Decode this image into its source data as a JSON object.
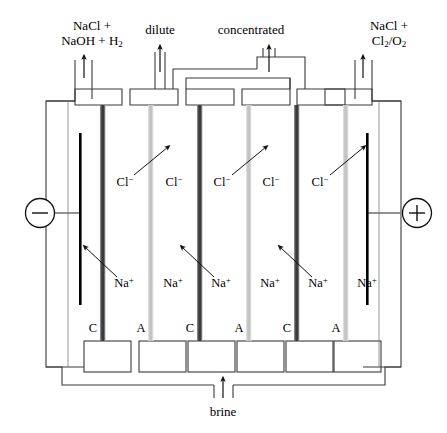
{
  "diagram": {
    "colors": {
      "line": "#3a3a3a",
      "electrode": "#000000",
      "cation_membrane": "#454545",
      "anion_membrane": "#c9c9c9",
      "background": "#ffffff"
    },
    "top_labels": [
      {
        "name": "outlet-left",
        "line1": "NaCl +",
        "line2_pre": "NaOH + H",
        "line2_sub": "2",
        "x": 92,
        "y": 18
      },
      {
        "name": "outlet-dilute",
        "line1": "dilute",
        "x": 160,
        "y": 22
      },
      {
        "name": "outlet-concentrated",
        "line1": "concentrated",
        "x": 250,
        "y": 22
      },
      {
        "name": "outlet-right",
        "line1": "NaCl +",
        "line2_pre": "Cl",
        "line2_sub": "2",
        "line2_mid": "/O",
        "line2_sub2": "2",
        "x": 389,
        "y": 18
      }
    ],
    "electrodes": {
      "cathode": {
        "label": "−",
        "name": "cathode-terminal",
        "x": 40,
        "y": 213
      },
      "anode": {
        "label": "+",
        "name": "anode-terminal",
        "x": 417,
        "y": 213
      }
    },
    "membranes": [
      {
        "id": "m1",
        "type": "cation",
        "letter": "C",
        "x": 103
      },
      {
        "id": "m2",
        "type": "anion",
        "letter": "A",
        "x": 151
      },
      {
        "id": "m3",
        "type": "cation",
        "letter": "C",
        "x": 200
      },
      {
        "id": "m4",
        "type": "anion",
        "letter": "A",
        "x": 249
      },
      {
        "id": "m5",
        "type": "cation",
        "letter": "C",
        "x": 297
      },
      {
        "id": "m6",
        "type": "anion",
        "letter": "A",
        "x": 346
      }
    ],
    "membrane_letters_y": 328,
    "chloride_labels": [
      {
        "text": "Cl",
        "charge": "−",
        "x": 125,
        "y": 179
      },
      {
        "text": "Cl",
        "charge": "−",
        "x": 174,
        "y": 179
      },
      {
        "text": "Cl",
        "charge": "−",
        "x": 222,
        "y": 179
      },
      {
        "text": "Cl",
        "charge": "−",
        "x": 271,
        "y": 179
      },
      {
        "text": "Cl",
        "charge": "−",
        "x": 320,
        "y": 179
      }
    ],
    "sodium_labels": [
      {
        "text": "Na",
        "charge": "+",
        "x": 124,
        "y": 280
      },
      {
        "text": "Na",
        "charge": "+",
        "x": 173,
        "y": 280
      },
      {
        "text": "Na",
        "charge": "+",
        "x": 221,
        "y": 280
      },
      {
        "text": "Na",
        "charge": "+",
        "x": 270,
        "y": 280
      },
      {
        "text": "Na",
        "charge": "+",
        "x": 318,
        "y": 280
      },
      {
        "text": "Na",
        "charge": "+",
        "x": 367,
        "y": 280
      }
    ],
    "bottom_label": {
      "name": "brine-inlet",
      "text": "brine",
      "x": 223,
      "y": 406
    },
    "compartments_note": "six ion-exchange membranes alternating cation (C) and anion (A) between cathode and anode"
  }
}
